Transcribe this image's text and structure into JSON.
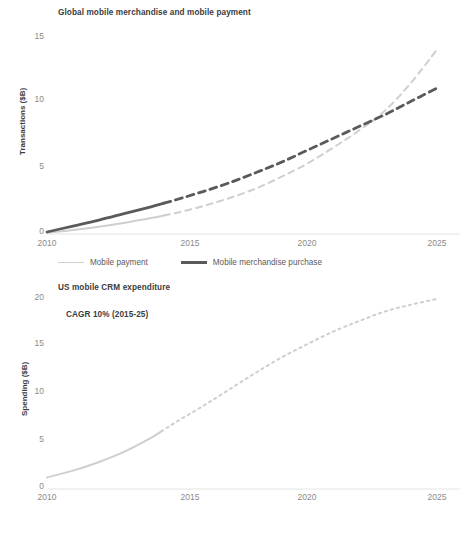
{
  "chart_data": [
    {
      "type": "line",
      "title": "Global mobile merchandise and mobile payment",
      "xlabel": "",
      "ylabel": "Transactions ($B)",
      "xlim": [
        2010,
        2025
      ],
      "ylim": [
        0,
        15
      ],
      "yticks": [
        "0",
        "5",
        "10",
        "15"
      ],
      "ytick_values": [
        0,
        5,
        10,
        15
      ],
      "xticks": [
        "2010",
        "2015",
        "2020",
        "2025"
      ],
      "xtick_values": [
        2010,
        2015,
        2020,
        2025
      ],
      "grid": false,
      "legend_position": "bottom",
      "x": [
        2010,
        2011,
        2012,
        2013,
        2014,
        2015,
        2016,
        2017,
        2018,
        2019,
        2020,
        2021,
        2022,
        2023,
        2024,
        2025
      ],
      "series": [
        {
          "name": "Mobile payment",
          "color": "#cfcfcf",
          "style": "dashed-after-2014.5",
          "values": [
            0.1,
            0.3,
            0.55,
            0.85,
            1.2,
            1.6,
            2.1,
            2.7,
            3.4,
            4.3,
            5.3,
            6.5,
            7.8,
            9.3,
            11.4,
            13.9
          ]
        },
        {
          "name": "Mobile merchandise purchase",
          "color": "#5a5a5a",
          "style": "dashed-after-2014.5",
          "values": [
            0.15,
            0.6,
            1.05,
            1.55,
            2.05,
            2.6,
            3.2,
            3.85,
            4.6,
            5.4,
            6.3,
            7.2,
            8.1,
            9.0,
            10.0,
            11.0
          ]
        }
      ],
      "annotations": []
    },
    {
      "type": "line",
      "title": "US mobile CRM expenditure",
      "xlabel": "",
      "ylabel": "Spending ($B)",
      "xlim": [
        2010,
        2025
      ],
      "ylim": [
        0,
        20
      ],
      "yticks": [
        "0",
        "5",
        "10",
        "15",
        "20"
      ],
      "ytick_values": [
        0,
        5,
        10,
        15,
        20
      ],
      "xticks": [
        "2010",
        "2015",
        "2020",
        "2025"
      ],
      "xtick_values": [
        2010,
        2015,
        2020,
        2025
      ],
      "grid": false,
      "legend_position": "none",
      "x": [
        2010,
        2011,
        2012,
        2013,
        2014,
        2015,
        2016,
        2017,
        2018,
        2019,
        2020,
        2021,
        2022,
        2023,
        2024,
        2025
      ],
      "series": [
        {
          "name": "US mobile CRM expenditure",
          "color": "#cfcfcf",
          "style": "dotted-after-2014.4",
          "values": [
            1.2,
            1.9,
            2.8,
            3.9,
            5.3,
            7.0,
            8.6,
            10.3,
            12.0,
            13.6,
            15.0,
            16.3,
            17.4,
            18.4,
            19.1,
            19.7
          ]
        }
      ],
      "annotations": [
        "CAGR 10% (2015-25)"
      ]
    }
  ],
  "top": {
    "title": "Global mobile merchandise and mobile payment",
    "ylabel": "Transactions ($B)",
    "yticks": [
      "15",
      "10",
      "5",
      "0"
    ],
    "xticks": [
      "2010",
      "2015",
      "2020",
      "2025"
    ],
    "legend": [
      {
        "label": "Mobile payment",
        "color": "#cfcfcf"
      },
      {
        "label": "Mobile merchandise purchase",
        "color": "#5a5a5a"
      }
    ]
  },
  "bottom": {
    "title": "US mobile CRM expenditure",
    "note": "CAGR 10% (2015-25)",
    "ylabel": "Spending ($B)",
    "yticks": [
      "20",
      "15",
      "10",
      "5",
      "0"
    ],
    "xticks": [
      "2010",
      "2015",
      "2020",
      "2025"
    ]
  }
}
